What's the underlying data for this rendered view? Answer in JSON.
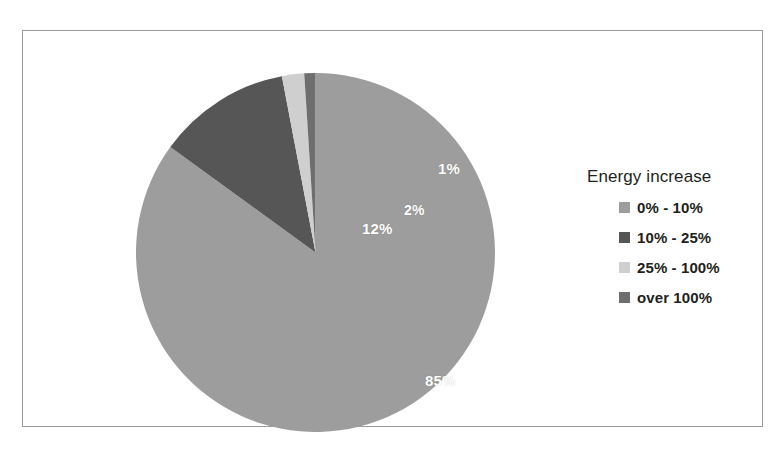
{
  "chart_data": {
    "type": "pie",
    "title": "",
    "legend_title": "Energy increase",
    "legend_position": "right",
    "grid": false,
    "categories": [
      "0% - 10%",
      "10% - 25%",
      "25% - 100%",
      "over 100%"
    ],
    "values": [
      85,
      12,
      2,
      1
    ],
    "value_labels": [
      "85%",
      "12%",
      "2%",
      "1%"
    ],
    "unit": "%",
    "colors": [
      "#9d9d9d",
      "#565656",
      "#cfcfcf",
      "#6e6e6e"
    ],
    "start_angle_deg": 0,
    "direction": "clockwise",
    "slices": [
      {
        "label": "0% - 10%",
        "value": 85,
        "display": "85%",
        "color": "#9d9d9d"
      },
      {
        "label": "10% - 25%",
        "value": 12,
        "display": "12%",
        "color": "#565656"
      },
      {
        "label": "25% - 100%",
        "value": 2,
        "display": "2%",
        "color": "#cfcfcf"
      },
      {
        "label": "over 100%",
        "value": 1,
        "display": "1%",
        "color": "#6e6e6e"
      }
    ]
  },
  "frame": {
    "border_color": "#9a9a9a",
    "background": "#ffffff"
  },
  "pie": {
    "labels": {
      "slice1": "85%",
      "slice2": "12%",
      "slice3": "2%",
      "slice4": "1%"
    },
    "label_color": "#ffffff"
  },
  "legend": {
    "title": "Energy increase",
    "items": [
      {
        "label": "0% - 10%",
        "color": "#9d9d9d"
      },
      {
        "label": "10% - 25%",
        "color": "#565656"
      },
      {
        "label": "25% - 100%",
        "color": "#cfcfcf"
      },
      {
        "label": "over 100%",
        "color": "#6e6e6e"
      }
    ]
  }
}
